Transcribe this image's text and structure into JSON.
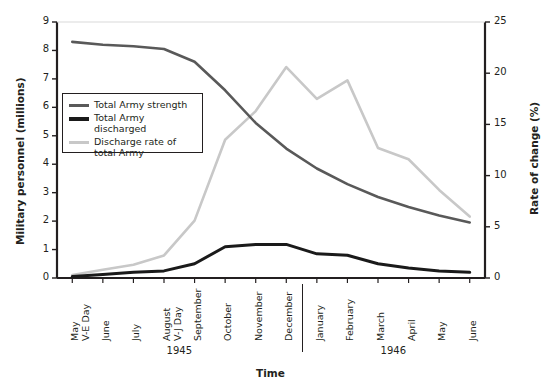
{
  "chart_data": {
    "type": "line",
    "title": "",
    "xlabel": "Time",
    "ylabel": "Military personnel (millions)",
    "y2label": "Rate of change (%)",
    "ylim": [
      0,
      9
    ],
    "y2lim": [
      0,
      25
    ],
    "yticks": [
      "0",
      "1",
      "2",
      "3",
      "4",
      "5",
      "6",
      "7",
      "8",
      "9"
    ],
    "y2ticks": [
      "0",
      "5",
      "10",
      "15",
      "20",
      "25"
    ],
    "grid": false,
    "legend_position": "upper-left-inside",
    "categories": [
      "May V-E Day",
      "June",
      "July",
      "August V-J Day",
      "September",
      "October",
      "November",
      "December",
      "January",
      "February",
      "March",
      "April",
      "May",
      "June"
    ],
    "category_lines": [
      [
        "May",
        "V-E Day"
      ],
      [
        "June",
        ""
      ],
      [
        "July",
        ""
      ],
      [
        "August",
        "V-J Day"
      ],
      [
        "September",
        ""
      ],
      [
        "October",
        ""
      ],
      [
        "November",
        ""
      ],
      [
        "December",
        ""
      ],
      [
        "January",
        ""
      ],
      [
        "February",
        ""
      ],
      [
        "March",
        ""
      ],
      [
        "April",
        ""
      ],
      [
        "May",
        ""
      ],
      [
        "June",
        ""
      ]
    ],
    "year_groups": [
      {
        "label": "1945",
        "start_index": 0,
        "end_index": 7
      },
      {
        "label": "1946",
        "start_index": 8,
        "end_index": 13
      }
    ],
    "series": [
      {
        "name": "Total Army strength",
        "axis": "left",
        "color": "#595959",
        "width": 2.6,
        "values": [
          8.3,
          8.2,
          8.15,
          8.05,
          7.6,
          6.6,
          5.45,
          4.55,
          3.85,
          3.3,
          2.85,
          2.5,
          2.2,
          1.95
        ]
      },
      {
        "name": "Total Army discharged",
        "axis": "left",
        "color": "#1a1a1a",
        "width": 3.0,
        "values": [
          0.05,
          0.12,
          0.2,
          0.25,
          0.5,
          1.1,
          1.18,
          1.18,
          0.85,
          0.8,
          0.5,
          0.35,
          0.25,
          0.2
        ]
      },
      {
        "name": "Discharge rate of total Army",
        "axis": "right",
        "color": "#c8c8c8",
        "width": 2.6,
        "values": [
          0.3,
          0.8,
          1.3,
          2.2,
          5.6,
          13.5,
          16.3,
          20.6,
          17.5,
          19.3,
          12.7,
          11.6,
          8.6,
          6.0
        ]
      }
    ]
  },
  "legend": {
    "items": [
      {
        "label_line1": "Total Army strength",
        "label_line2": ""
      },
      {
        "label_line1": "Total Army discharged",
        "label_line2": ""
      },
      {
        "label_line1": "Discharge rate of",
        "label_line2": "total Army"
      }
    ]
  }
}
